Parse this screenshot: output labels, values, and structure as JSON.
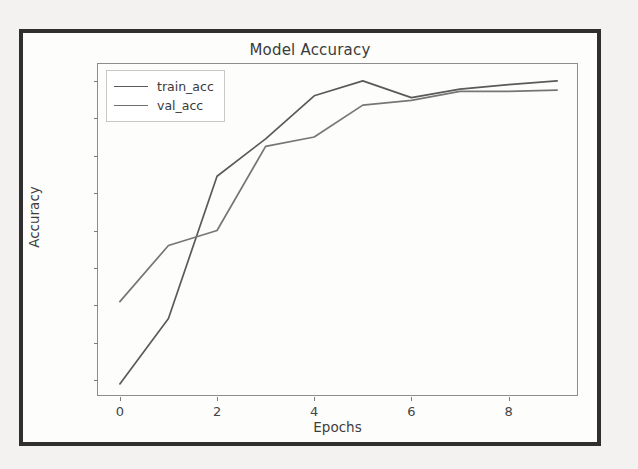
{
  "figure": {
    "title": "Model Accuracy"
  },
  "axes": {
    "xlabel": "Epochs",
    "ylabel": "Accuracy",
    "xticks": [
      "0",
      "2",
      "4",
      "6",
      "8"
    ],
    "yticks": [
      "0.2",
      "0.3",
      "0.4",
      "0.5",
      "0.6",
      "0.7",
      "0.8",
      "0.9",
      "1.0"
    ]
  },
  "legend": {
    "entries": [
      {
        "label": "train_acc",
        "color": "#5a5a5a"
      },
      {
        "label": "val_acc",
        "color": "#6f6f6f"
      }
    ]
  },
  "chart_data": {
    "type": "line",
    "title": "Model Accuracy",
    "xlabel": "Epochs",
    "ylabel": "Accuracy",
    "x": [
      0,
      1,
      2,
      3,
      4,
      5,
      6,
      7,
      8,
      9
    ],
    "xlim": [
      -0.45,
      9.45
    ],
    "ylim": [
      0.155,
      1.045
    ],
    "grid": false,
    "legend_position": "upper left",
    "series": [
      {
        "name": "train_acc",
        "color": "#5a5a5a",
        "values": [
          0.19,
          0.365,
          0.745,
          0.845,
          0.96,
          1.0,
          0.955,
          0.978,
          0.99,
          1.0
        ]
      },
      {
        "name": "val_acc",
        "color": "#6f6f6f",
        "values": [
          0.41,
          0.56,
          0.6,
          0.825,
          0.85,
          0.935,
          0.948,
          0.972,
          0.972,
          0.975
        ]
      }
    ]
  }
}
